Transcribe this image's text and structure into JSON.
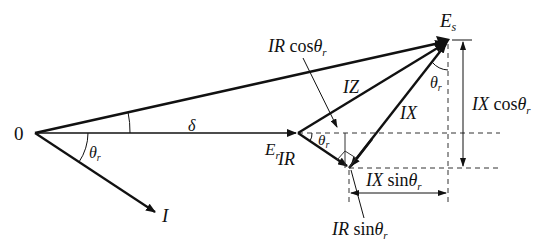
{
  "diagram": {
    "origin_label": "0",
    "labels": {
      "Es": "E",
      "Es_sub": "s",
      "Er": "E",
      "Er_sub": "r",
      "I": "I",
      "IZ": "IZ",
      "IX": "IX",
      "IR": "IR",
      "delta": "δ",
      "theta_r_origin": "θ",
      "theta_r_origin_sub": "r",
      "theta_r_Er": "θ",
      "theta_r_Er_sub": "r",
      "theta_r_Es": "θ",
      "theta_r_Es_sub": "r",
      "IR_cos_prefix": "IR",
      "IR_cos_func": " cos",
      "IR_cos_theta": "θ",
      "IR_cos_sub": "r",
      "IX_cos_prefix": "IX",
      "IX_cos_func": " cos",
      "IX_cos_theta": "θ",
      "IX_cos_sub": "r",
      "IX_sin_prefix": "IX",
      "IX_sin_func": " sin",
      "IX_sin_theta": "θ",
      "IX_sin_sub": "r",
      "IR_sin_prefix": "IR",
      "IR_sin_func": " sin",
      "IR_sin_theta": "θ",
      "IR_sin_sub": "r"
    },
    "colors": {
      "stroke": "#111111",
      "background": "#ffffff"
    }
  }
}
